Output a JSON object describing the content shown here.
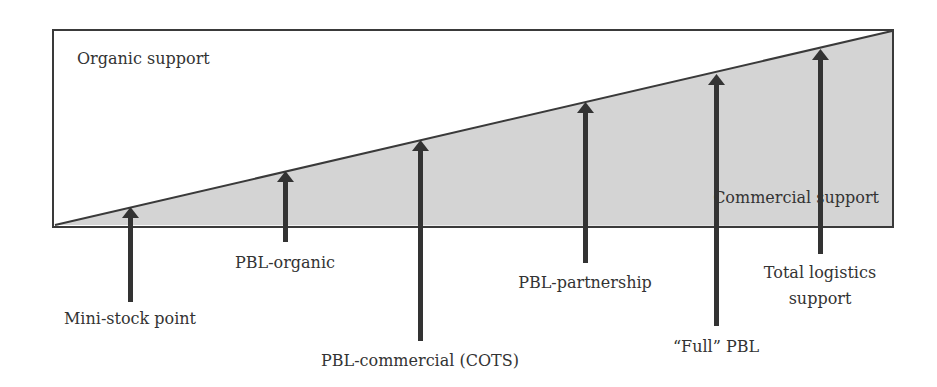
{
  "diagram": {
    "colors": {
      "background": "#ffffff",
      "commercial_fill": "#d4d4d4",
      "stroke": "#3a3a3a",
      "arrow": "#333333",
      "text": "#333333"
    },
    "regions": {
      "organic_label": "Organic support",
      "commercial_label": "Commercial support"
    },
    "arrows": [
      {
        "label": "Mini-stock point"
      },
      {
        "label": "PBL-organic"
      },
      {
        "label": "PBL-commercial (COTS)"
      },
      {
        "label": "PBL-partnership"
      },
      {
        "label": "“Full” PBL"
      },
      {
        "label_line1": "Total logistics",
        "label_line2": "support"
      }
    ]
  }
}
